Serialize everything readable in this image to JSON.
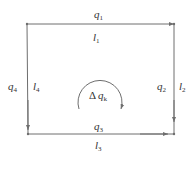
{
  "diagram": {
    "title": "",
    "colors": {
      "line": "#6e6e6e",
      "text": "#333333",
      "background": "#ffffff"
    },
    "edges": {
      "top": {
        "flow": "q",
        "flow_sub": "1",
        "length": "l",
        "length_sub": "1"
      },
      "right": {
        "flow": "q",
        "flow_sub": "2",
        "length": "l",
        "length_sub": "2"
      },
      "bottom": {
        "flow": "q",
        "flow_sub": "3",
        "length": "l",
        "length_sub": "3"
      },
      "left": {
        "flow": "q",
        "flow_sub": "4",
        "length": "l",
        "length_sub": "4"
      }
    },
    "loop": {
      "delta": "Δ",
      "symbol": "q",
      "sub": "k",
      "direction": "clockwise"
    }
  }
}
